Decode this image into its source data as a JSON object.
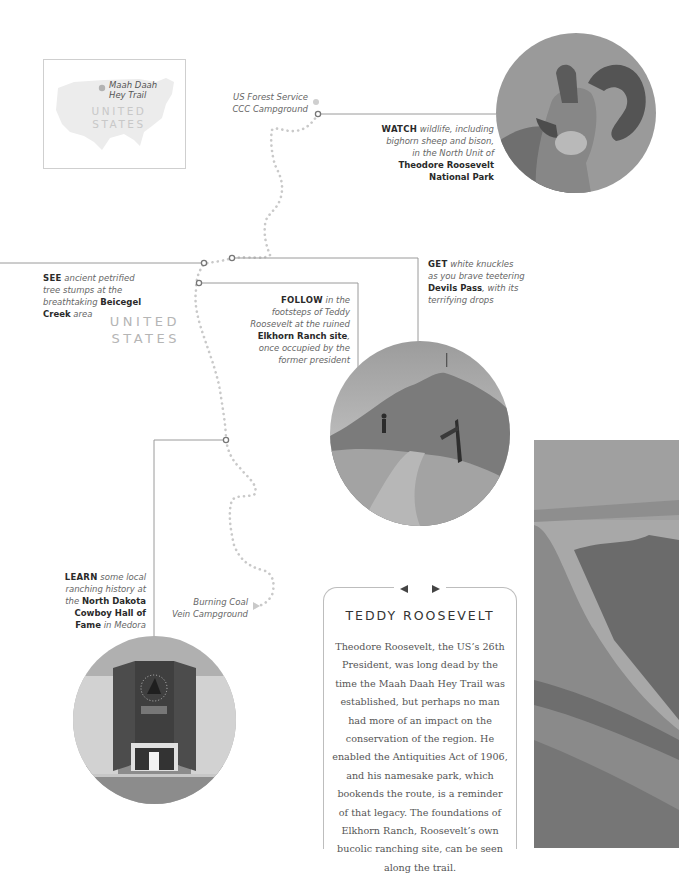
{
  "inset_map": {
    "trail_label_line1": "Maah Daah",
    "trail_label_line2": "Hey Trail",
    "country_line1": "UNITED",
    "country_line2": "STATES"
  },
  "main_map": {
    "country_line1": "UNITED",
    "country_line2": "STATES",
    "trail_color": "#c9c9c9",
    "connector_color": "#8f8f8f"
  },
  "campgrounds": {
    "north": {
      "line1": "US Forest Service",
      "line2": "CCC Campground"
    },
    "south": {
      "line1": "Burning Coal",
      "line2": "Vein Campground"
    }
  },
  "callouts": {
    "watch": {
      "keyword": "WATCH",
      "line1_rest": " wildlife, including",
      "line2": "bighorn sheep and bison,",
      "line3": "in the North Unit of",
      "bold1": "Theodore Roosevelt",
      "bold2": "National Park"
    },
    "see": {
      "keyword": "SEE",
      "line1_rest": " ancient petrified",
      "line2": "tree stumps at the",
      "line3_pre": "breathtaking ",
      "line3_bold": "Beicegel",
      "line4_bold": "Creek",
      "line4_rest": " area"
    },
    "follow": {
      "keyword": "FOLLOW",
      "line1_rest": " in the",
      "line2": "footsteps of Teddy",
      "line3": "Roosevelt at the ruined",
      "line4_bold": "Elkhorn Ranch site",
      "line4_rest": ",",
      "line5": "once occupied by the",
      "line6": "former president"
    },
    "get": {
      "keyword": "GET",
      "line1_rest": " white knuckles",
      "line2": "as you brave teetering",
      "line3_bold": "Devils Pass",
      "line3_rest": ", with its",
      "line4": "terrifying drops"
    },
    "learn": {
      "keyword": "LEARN",
      "line1_rest": " some local",
      "line2": "ranching history at",
      "line3_pre": "the ",
      "line3_bold": "North Dakota",
      "line4_bold": "Cowboy Hall of",
      "line5_bold": "Fame",
      "line5_rest": " in Medora"
    }
  },
  "photos": {
    "bighorn": "bighorn-sheep-photo",
    "devils_pass": "devils-pass-hiker-photo",
    "hall_of_fame": "cowboy-hall-of-fame-photo",
    "badlands": "badlands-cliff-photo"
  },
  "sidebar": {
    "title": "TEDDY ROOSEVELT",
    "body": "Theodore Roosevelt, the US’s 26th President, was long dead by the time the Maah Daah Hey Trail was established, but perhaps no man had more of an impact on the conservation of the region. He enabled the Antiquities Act of 1906, and his namesake park, which bookends the route, is a reminder of that legacy. The foundations of Elkhorn Ranch, Roosevelt’s own bucolic ranching site, can be seen along the trail."
  }
}
